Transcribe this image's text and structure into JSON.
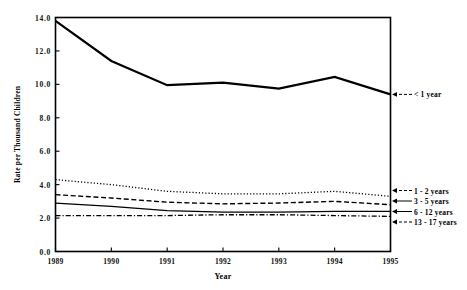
{
  "chart_data": {
    "type": "line",
    "title": "",
    "xlabel": "Year",
    "ylabel": "Rate per Thousand Children",
    "x": [
      1989,
      1990,
      1991,
      1992,
      1993,
      1994,
      1995
    ],
    "xtick_labels": [
      "1989",
      "1990",
      "1991",
      "1992",
      "1993",
      "1994",
      "1995"
    ],
    "ytick_labels": [
      "0.0",
      "2.0",
      "4.0",
      "6.0",
      "8.0",
      "10.0",
      "12.0",
      "14.0"
    ],
    "ytick_values": [
      0,
      20,
      40,
      60,
      80,
      100,
      120,
      140
    ],
    "ylim": [
      0,
      140
    ],
    "xlim": [
      1989,
      1995
    ],
    "grid": false,
    "legend_position": "right-annotations",
    "series": [
      {
        "name": "< 1 year",
        "label": "< 1 year",
        "style": "solid",
        "values": [
          138,
          114,
          99.5,
          101,
          97.5,
          104.5,
          94
        ]
      },
      {
        "name": "1 - 2 years",
        "label": "1 - 2 years",
        "style": "dotted",
        "values": [
          43,
          40,
          36,
          34.5,
          34.5,
          36,
          33
        ]
      },
      {
        "name": "3 - 5 years",
        "label": "3 - 5 years",
        "style": "dashed",
        "values": [
          34,
          32,
          29.5,
          28.5,
          29,
          30,
          28
        ]
      },
      {
        "name": "6 - 12 years",
        "label": "6 - 12 years",
        "style": "solid-thin",
        "values": [
          29,
          27,
          24.5,
          23.5,
          23.5,
          24,
          24
        ]
      },
      {
        "name": "13 - 17 years",
        "label": "13 - 17 years",
        "style": "dash-dot",
        "values": [
          21.5,
          21.5,
          21.5,
          22,
          22,
          21.5,
          21
        ]
      }
    ]
  },
  "axes": {
    "xlabel": "Year",
    "ylabel": "Rate per Thousand Children"
  }
}
